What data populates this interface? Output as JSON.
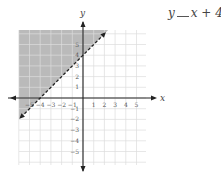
{
  "problem": {
    "equation_lhs": "y",
    "equation_blank": "__",
    "equation_rhs": "x + 4"
  },
  "chart_data": {
    "type": "line",
    "title": "",
    "xlabel": "x",
    "ylabel": "y",
    "xlim": [
      -6,
      6
    ],
    "ylim": [
      -6,
      6
    ],
    "grid": true,
    "x_ticks": [
      -5,
      -4,
      -3,
      -2,
      -1,
      1,
      2,
      3,
      4,
      5
    ],
    "y_ticks": [
      -5,
      -4,
      -3,
      -2,
      -1,
      1,
      2,
      3,
      4,
      5
    ],
    "x_tick_labels": [
      "−5",
      "−4",
      "−3",
      "−2",
      "−1",
      "1",
      "2",
      "3",
      "4",
      "5"
    ],
    "y_tick_labels": [
      "5",
      "4",
      "3",
      "2",
      "1",
      "−1",
      "−2",
      "−3",
      "−4",
      "−5"
    ],
    "boundary_line": {
      "equation": "y = x + 4",
      "slope": 1,
      "intercept": 4,
      "style": "dashed",
      "points": [
        [
          -6,
          -2
        ],
        [
          2,
          6
        ]
      ]
    },
    "shaded_region": {
      "description": "above the line (y > x + 4)",
      "color": "#b3b3b3"
    },
    "colors": {
      "grid": "#dcdcdc",
      "axis": "#222222",
      "line": "#222222",
      "shade": "#b3b3b3",
      "labels": "#555555"
    }
  }
}
